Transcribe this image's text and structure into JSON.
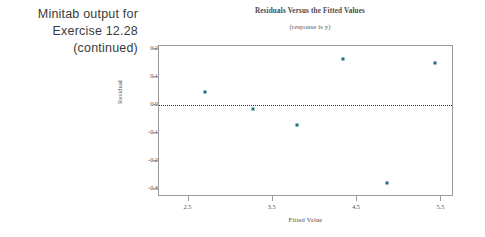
{
  "caption": {
    "lines": [
      "Minitab output for",
      "Exercise 12.28",
      "(continued)"
    ]
  },
  "chart_data": {
    "type": "scatter",
    "title": "Residuals Versus the Fitted Values",
    "subtitle": "(response is y)",
    "xlabel": "Fitted Value",
    "ylabel": "Residual",
    "xlim": [
      2.15,
      5.65
    ],
    "ylim": [
      -0.33,
      0.21
    ],
    "xticks": [
      2.5,
      3.5,
      4.5,
      5.5
    ],
    "xtick_labels": [
      "2.5",
      "3.5",
      "4.5",
      "5.5"
    ],
    "yticks": [
      0.2,
      0.1,
      0.0,
      -0.1,
      -0.2,
      -0.3
    ],
    "ytick_labels": [
      "0.2",
      "0.1",
      "0.0",
      "-0.1",
      "-0.2",
      "-0.3"
    ],
    "grid": false,
    "legend": null,
    "reference_line": {
      "y": 0.0,
      "style": "dotted",
      "color": "#2b2b2b"
    },
    "marker_color": "#1f6f7a",
    "points": [
      {
        "x": 2.7,
        "y": 0.045
      },
      {
        "x": 3.26,
        "y": -0.015
      },
      {
        "x": 3.79,
        "y": -0.072
      },
      {
        "x": 4.33,
        "y": 0.165
      },
      {
        "x": 4.86,
        "y": -0.28
      },
      {
        "x": 5.42,
        "y": 0.15
      }
    ]
  }
}
